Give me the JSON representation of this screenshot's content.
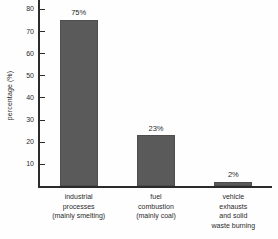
{
  "chart_data": {
    "type": "bar",
    "title": "",
    "xlabel": "",
    "ylabel": "percentage (%)",
    "ylim": [
      0,
      84
    ],
    "yticks": [
      10,
      20,
      30,
      40,
      50,
      60,
      70,
      80
    ],
    "grid": false,
    "legend": "none",
    "bar_color": "#5a5a5a",
    "axis_color": "#2b2b2b",
    "categories": [
      "industrial processes (mainly smelting)",
      "fuel combustion (mainly coal)",
      "vehicle exhausts and solid waste burning"
    ],
    "category_lines": [
      [
        "industrial",
        "processes",
        "(mainly smelting)"
      ],
      [
        "fuel",
        "combustion",
        "(mainly coal)"
      ],
      [
        "vehicle",
        "exhausts",
        "and solid",
        "waste burning"
      ]
    ],
    "values": [
      75,
      23,
      2
    ],
    "value_labels": [
      "75%",
      "23%",
      "2%"
    ]
  }
}
